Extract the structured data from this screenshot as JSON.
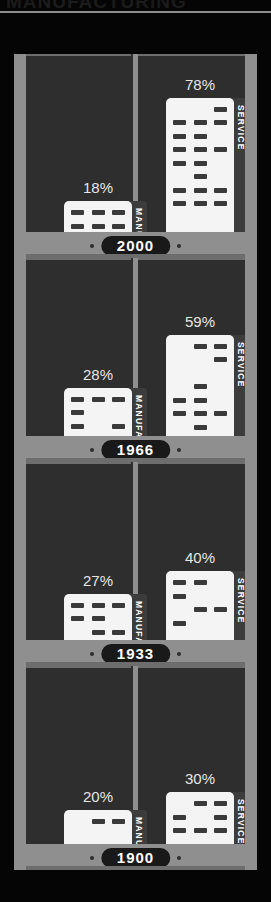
{
  "title": "MANUFACTURING",
  "legend": {
    "manufacturing_label": "MANUFACTURING",
    "service_label": "SERVICE"
  },
  "colors": {
    "background": "#050505",
    "frame": "#8f8f8f",
    "panel": "#2e2e2e",
    "building": "#f4f4f4",
    "window": "#3a3a3a",
    "tab": "#3c3c3c",
    "pill": "#191919",
    "label_text": "#e6e6e6"
  },
  "chart_data": {
    "type": "bar",
    "title": "MANUFACTURING",
    "xlabel": "",
    "ylabel": "",
    "ylim": [
      0,
      100
    ],
    "orientation": "vertical",
    "grid": false,
    "legend_position": "inline-vertical-tab",
    "categories": [
      "2000",
      "1966",
      "1933",
      "1900"
    ],
    "series": [
      {
        "name": "MANUFACTURING",
        "values": [
          18,
          28,
          27,
          20
        ],
        "unit": "%"
      },
      {
        "name": "SERVICE",
        "values": [
          78,
          59,
          40,
          30
        ],
        "unit": "%"
      }
    ],
    "rows": [
      {
        "year": "2000",
        "manufacturing": {
          "label": "18%",
          "value": 18,
          "tab_text": "MANUFACTURING"
        },
        "service": {
          "label": "78%",
          "value": 78,
          "tab_text": "SERVICE"
        }
      },
      {
        "year": "1966",
        "manufacturing": {
          "label": "28%",
          "value": 28,
          "tab_text": "MANUFACTURING"
        },
        "service": {
          "label": "59%",
          "value": 59,
          "tab_text": "SERVICE"
        }
      },
      {
        "year": "1933",
        "manufacturing": {
          "label": "27%",
          "value": 27,
          "tab_text": "MANUFACTURING"
        },
        "service": {
          "label": "40%",
          "value": 40,
          "tab_text": "SERVICE"
        }
      },
      {
        "year": "1900",
        "manufacturing": {
          "label": "20%",
          "value": 20,
          "tab_text": "MANUFACTURING"
        },
        "service": {
          "label": "30%",
          "value": 30,
          "tab_text": "SERVICE"
        }
      }
    ]
  }
}
